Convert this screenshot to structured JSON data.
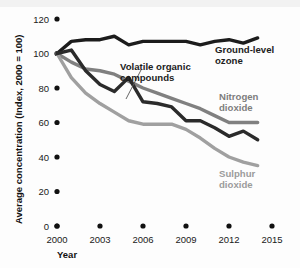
{
  "chart_data": {
    "type": "line",
    "title": "",
    "xlabel": "Year",
    "ylabel": "Average concentration (Index, 2000 = 100)",
    "xlim": [
      2000,
      2015
    ],
    "ylim": [
      0,
      120
    ],
    "xticks": [
      2000,
      2003,
      2006,
      2009,
      2012,
      2015
    ],
    "xtick_labels": [
      "2000",
      "2003",
      "2006",
      "2009",
      "2012",
      "2015"
    ],
    "yticks": [
      0,
      20,
      40,
      60,
      80,
      100,
      120
    ],
    "ytick_labels": [
      "0",
      "20",
      "40",
      "60",
      "80",
      "100",
      "120"
    ],
    "grid": false,
    "legend": "inline-annotations",
    "x": [
      2000,
      2001,
      2002,
      2003,
      2004,
      2005,
      2006,
      2007,
      2008,
      2009,
      2010,
      2011,
      2012,
      2013,
      2014
    ],
    "series": [
      {
        "name": "Ground-level ozone",
        "color": "#1c1c1c",
        "values": [
          100,
          107,
          108,
          108,
          110,
          105,
          107,
          107,
          107,
          107,
          105,
          107,
          108,
          106,
          109
        ]
      },
      {
        "name": "Volatile organic compounds",
        "color": "#2b2b2b",
        "values": [
          100,
          102,
          90,
          82,
          78,
          86,
          72,
          71,
          69,
          61,
          61,
          57,
          52,
          55,
          50
        ]
      },
      {
        "name": "Nitrogen dioxide",
        "color": "#808080",
        "values": [
          100,
          95,
          91,
          90,
          88,
          84,
          80,
          77,
          74,
          71,
          68,
          64,
          60,
          60,
          60
        ]
      },
      {
        "name": "Sulphur dioxide",
        "color": "#a0a0a0",
        "values": [
          100,
          86,
          77,
          71,
          66,
          61,
          59,
          59,
          59,
          56,
          51,
          45,
          40,
          37,
          35
        ]
      }
    ],
    "annotations": [
      {
        "name": "ground-level-ozone",
        "text_line1": "Ground-level",
        "text_line2": "ozone",
        "color": "#1c1c1c"
      },
      {
        "name": "volatile-organic-compounds",
        "text_line1": "Volatile organic",
        "text_line2": "compounds",
        "color": "#1c1c1c"
      },
      {
        "name": "nitrogen-dioxide",
        "text_line1": "Nitrogen",
        "text_line2": "dioxide",
        "color": "#7d7d7d"
      },
      {
        "name": "sulphur-dioxide",
        "text_line1": "Sulphur",
        "text_line2": "dioxide",
        "color": "#9b9b9b"
      }
    ]
  }
}
